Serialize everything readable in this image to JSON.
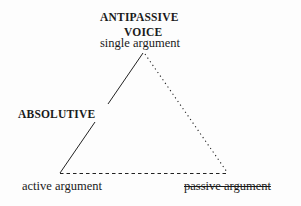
{
  "diagram": {
    "apex": {
      "title_line1": "ANTIPASSIVE",
      "title_line2": "VOICE",
      "sublabel": "single argument"
    },
    "left_edge_label": "ABSOLUTIVE",
    "bottom_left_label": "active argument",
    "bottom_right_label": "passive argument",
    "bottom_right_struck": true,
    "edges": [
      {
        "from": "single argument",
        "to": "active argument",
        "style": "solid",
        "label": "ABSOLUTIVE"
      },
      {
        "from": "single argument",
        "to": "passive argument",
        "style": "dotted"
      },
      {
        "from": "active argument",
        "to": "passive argument",
        "style": "dashed"
      }
    ],
    "colors": {
      "line": "#222222",
      "text": "#1a1a1a",
      "background": "#fdfdfd"
    }
  }
}
